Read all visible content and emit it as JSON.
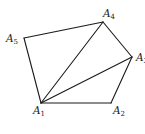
{
  "diagram": {
    "type": "pentagon-triangulation",
    "stroke_color": "#1a1a1a",
    "background": "#ffffff",
    "vertices": [
      {
        "id": "A1",
        "letter": "A",
        "sub": "1",
        "x": 41,
        "y": 103,
        "label_x": 33,
        "label_y": 114
      },
      {
        "id": "A2",
        "letter": "A",
        "sub": "2",
        "x": 111,
        "y": 103,
        "label_x": 113,
        "label_y": 114
      },
      {
        "id": "A3",
        "letter": "A",
        "sub": "3",
        "x": 132,
        "y": 57,
        "label_x": 136,
        "label_y": 61
      },
      {
        "id": "A4",
        "letter": "A",
        "sub": "4",
        "x": 103,
        "y": 22,
        "label_x": 103,
        "label_y": 17
      },
      {
        "id": "A5",
        "letter": "A",
        "sub": "5",
        "x": 24,
        "y": 38,
        "label_x": 6,
        "label_y": 42
      }
    ],
    "edges": [
      {
        "from": "A1",
        "to": "A2",
        "kind": "side"
      },
      {
        "from": "A2",
        "to": "A3",
        "kind": "side"
      },
      {
        "from": "A3",
        "to": "A4",
        "kind": "side"
      },
      {
        "from": "A4",
        "to": "A5",
        "kind": "side"
      },
      {
        "from": "A5",
        "to": "A1",
        "kind": "side"
      },
      {
        "from": "A1",
        "to": "A3",
        "kind": "diagonal"
      },
      {
        "from": "A1",
        "to": "A4",
        "kind": "diagonal"
      }
    ],
    "labels": {
      "A1": {
        "letter": "A",
        "sub": "1"
      },
      "A2": {
        "letter": "A",
        "sub": "2"
      },
      "A3": {
        "letter": "A",
        "sub": "3"
      },
      "A4": {
        "letter": "A",
        "sub": "4"
      },
      "A5": {
        "letter": "A",
        "sub": "5"
      }
    }
  }
}
